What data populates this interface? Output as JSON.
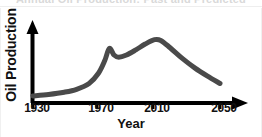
{
  "figure": {
    "title_faded": "Annual Oil Production: Past and Predicted",
    "title_visible": false
  },
  "chart_data": {
    "type": "line",
    "title": "Annual Oil Production: Past and Predicted",
    "xlabel": "Year",
    "ylabel": "Oil Production",
    "xlim": [
      1930,
      2060
    ],
    "ylim": [
      0,
      100
    ],
    "grid": false,
    "legend": null,
    "xticks": [
      1930,
      1970,
      2010,
      2050
    ],
    "xtick_labels": [
      "1930",
      "1970",
      "2010",
      "2050"
    ],
    "yticks": [],
    "ytick_labels": [],
    "line_color": "#4a4a4a",
    "line_width": 5,
    "series": [
      {
        "name": "Oil Production",
        "x": [
          1930,
          1940,
          1950,
          1958,
          1966,
          1972,
          1976,
          1979,
          1982,
          1985,
          1990,
          1996,
          2002,
          2008,
          2012,
          2018,
          2026,
          2034,
          2042,
          2050
        ],
        "values": [
          7,
          9,
          12,
          16,
          24,
          38,
          55,
          72,
          63,
          60,
          63,
          70,
          78,
          84,
          83,
          73,
          58,
          45,
          34,
          24
        ]
      }
    ]
  },
  "axes": {
    "x_axis_arrow": true,
    "y_axis_arrow": true,
    "axis_color": "#000000"
  }
}
